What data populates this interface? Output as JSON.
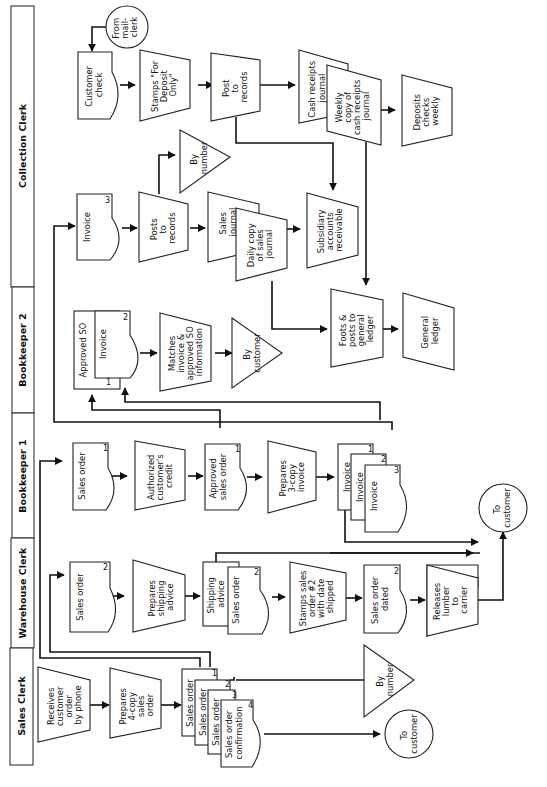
{
  "diagram": {
    "title": "",
    "orientation": "rotated-90-ccw",
    "swimlanes": [
      {
        "id": "collection",
        "label": "Collection Clerk"
      },
      {
        "id": "bk2",
        "label": "Bookkeeper 2"
      },
      {
        "id": "bk1",
        "label": "Bookkeeper 1"
      },
      {
        "id": "warehouse",
        "label": "Warehouse Clerk"
      },
      {
        "id": "sales",
        "label": "Sales Clerk"
      }
    ],
    "nodes": {
      "sales_receives": {
        "lines": [
          "Receives",
          "customer",
          "order",
          "by phone"
        ],
        "type": "manual-operation"
      },
      "sales_prepares": {
        "lines": [
          "Prepares",
          "4-copy",
          "sales",
          "order"
        ],
        "type": "manual-operation"
      },
      "sales_doc1": {
        "lines": [
          "Sales order"
        ],
        "num": "1",
        "type": "document"
      },
      "sales_doc2": {
        "lines": [
          "Sales order"
        ],
        "num": "2",
        "type": "document"
      },
      "sales_doc3": {
        "lines": [
          "Sales order"
        ],
        "num": "3",
        "type": "document"
      },
      "sales_doc4": {
        "lines": [
          "Sales order",
          "confirmation"
        ],
        "num": "4",
        "type": "document"
      },
      "sales_file": {
        "lines": [
          "By",
          "number"
        ],
        "type": "file"
      },
      "sales_to_customer": {
        "lines": [
          "To",
          "customer"
        ],
        "type": "terminal"
      },
      "wh_so": {
        "lines": [
          "Sales order"
        ],
        "num": "2",
        "type": "document"
      },
      "wh_prepares": {
        "lines": [
          "Prepares",
          "shipping",
          "advice"
        ],
        "type": "manual-operation"
      },
      "wh_shipping": {
        "lines": [
          "Shipping",
          "advice"
        ],
        "type": "document"
      },
      "wh_so2": {
        "lines": [
          "Sales order"
        ],
        "num": "2",
        "type": "document"
      },
      "wh_stamps": {
        "lines": [
          "Stamps sales",
          "order #2",
          "with date",
          "shipped"
        ],
        "type": "manual-operation"
      },
      "wh_dated": {
        "lines": [
          "Sales order",
          "dated"
        ],
        "num": "2",
        "type": "document"
      },
      "wh_releases": {
        "lines": [
          "Releases",
          "lumber",
          "to",
          "carrier"
        ],
        "type": "manual-operation"
      },
      "wh_to_customer": {
        "lines": [
          "To",
          "customer"
        ],
        "type": "terminal"
      },
      "bk1_so": {
        "lines": [
          "Sales order"
        ],
        "num": "1",
        "type": "document"
      },
      "bk1_auth": {
        "lines": [
          "Authorized",
          "customer's",
          "credit"
        ],
        "type": "manual-operation"
      },
      "bk1_approved": {
        "lines": [
          "Approved",
          "sales order"
        ],
        "num": "1",
        "type": "document"
      },
      "bk1_prepares": {
        "lines": [
          "Prepares",
          "3-copy",
          "invoice"
        ],
        "type": "manual-operation"
      },
      "bk1_inv1": {
        "lines": [
          "Invoice"
        ],
        "num": "1",
        "type": "document"
      },
      "bk1_inv2": {
        "lines": [
          "Invoice"
        ],
        "num": "2",
        "type": "document"
      },
      "bk1_inv3": {
        "lines": [
          "Invoice"
        ],
        "num": "3",
        "type": "document"
      },
      "bk2_approved": {
        "lines": [
          "Approved SO"
        ],
        "num": "1",
        "type": "document"
      },
      "bk2_invoice": {
        "lines": [
          "Invoice"
        ],
        "num": "2",
        "type": "document"
      },
      "bk2_matches": {
        "lines": [
          "Matches",
          "invoice &",
          "approved SO",
          "information"
        ],
        "type": "manual-operation"
      },
      "bk2_file": {
        "lines": [
          "By",
          "customer"
        ],
        "type": "file"
      },
      "cc_invoice": {
        "lines": [
          "Invoice"
        ],
        "num": "3",
        "type": "document"
      },
      "cc_posts": {
        "lines": [
          "Posts",
          "to",
          "records"
        ],
        "type": "manual-operation"
      },
      "cc_file": {
        "lines": [
          "By",
          "number"
        ],
        "type": "file"
      },
      "cc_sales_journal": {
        "lines": [
          "Sales",
          "journal"
        ],
        "type": "ledger"
      },
      "cc_daily_copy": {
        "lines": [
          "Daily copy",
          "of sales",
          "journal"
        ],
        "type": "ledger"
      },
      "cc_subsidiary": {
        "lines": [
          "Subsidiary",
          "accounts",
          "receivable"
        ],
        "type": "ledger"
      },
      "cc_foots": {
        "lines": [
          "Foots &",
          "posts to",
          "general",
          "ledger"
        ],
        "type": "manual-operation"
      },
      "cc_general_ledger": {
        "lines": [
          "General",
          "ledger"
        ],
        "type": "ledger"
      },
      "cc_from_mail": {
        "lines": [
          "From",
          "mail-",
          "clerk"
        ],
        "type": "terminal"
      },
      "cc_check": {
        "lines": [
          "Customer",
          "check"
        ],
        "type": "document"
      },
      "cc_stamps": {
        "lines": [
          "Stamps \"For",
          "Deposit",
          "Only\""
        ],
        "type": "manual-operation"
      },
      "cc_post": {
        "lines": [
          "Post",
          "to",
          "records"
        ],
        "type": "manual-operation"
      },
      "cc_cash_journal": {
        "lines": [
          "Cash receipts",
          "journal"
        ],
        "type": "ledger"
      },
      "cc_weekly_copy": {
        "lines": [
          "Weekly",
          "copy of",
          "cash receipts",
          "journal"
        ],
        "type": "ledger"
      },
      "cc_deposits": {
        "lines": [
          "Deposits",
          "checks",
          "weekly"
        ],
        "type": "manual-operation"
      }
    }
  }
}
